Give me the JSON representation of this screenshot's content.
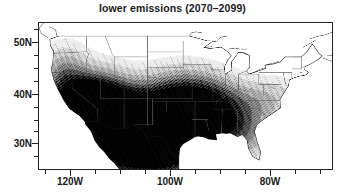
{
  "chart_data": {
    "type": "heatmap",
    "title": "lower emissions (2070–2099)",
    "xlabel": "",
    "ylabel": "",
    "grid": false,
    "legend": false,
    "projection": "lambert-conformal-conic",
    "region": "contiguous United States",
    "xlim": [
      -127,
      -65
    ],
    "ylim": [
      23.5,
      51.5
    ],
    "xtick_labels": [
      "120W",
      "100W",
      "80W"
    ],
    "xtick_values": [
      -120,
      -100,
      -80
    ],
    "xtick_minor_values": [
      -125,
      -115,
      -110,
      -105,
      -95,
      -90,
      -85,
      -75,
      -70
    ],
    "ytick_labels": [
      "50N",
      "40N",
      "30N"
    ],
    "ytick_values": [
      50,
      40,
      30
    ],
    "ytick_minor_values": [
      25,
      27.5,
      32.5,
      35,
      37.5,
      42.5,
      45,
      47.5
    ],
    "shading_description": "grayscale stippled density; darkest over the desert Southwest and northern Mexico, intermediate over the southern Great Plains and lower Mississippi valley, light over the Southeast and mid-Atlantic, white over the northern Rockies, northern Great Plains and Upper Midwest",
    "shading_scale": [
      "white",
      "#e8e8e8",
      "#cfcfcf",
      "#b0b0b0",
      "#8a8a8a",
      "#5a5a5a",
      "#2a2a2a",
      "#000000"
    ],
    "regions": [
      {
        "name": "desert Southwest",
        "intensity": 1.0,
        "shade": "#000000"
      },
      {
        "name": "southern California",
        "intensity": 0.95,
        "shade": "#111111"
      },
      {
        "name": "northern Mexico",
        "intensity": 0.98,
        "shade": "#050505"
      },
      {
        "name": "south Texas",
        "intensity": 0.85,
        "shade": "#333333"
      },
      {
        "name": "southern Great Plains",
        "intensity": 0.55,
        "shade": "#8a8a8a"
      },
      {
        "name": "lower Mississippi valley",
        "intensity": 0.45,
        "shade": "#a8a8a8"
      },
      {
        "name": "Southeast",
        "intensity": 0.25,
        "shade": "#d4d4d4"
      },
      {
        "name": "mid-Atlantic",
        "intensity": 0.2,
        "shade": "#dedede"
      },
      {
        "name": "Great Basin",
        "intensity": 0.6,
        "shade": "#787878"
      },
      {
        "name": "Pacific Northwest",
        "intensity": 0.3,
        "shade": "#c8c8c8"
      },
      {
        "name": "northern Rockies",
        "intensity": 0.05,
        "shade": "#ffffff"
      },
      {
        "name": "northern Great Plains",
        "intensity": 0.05,
        "shade": "#ffffff"
      },
      {
        "name": "Upper Midwest",
        "intensity": 0.1,
        "shade": "#f2f2f2"
      },
      {
        "name": "Northeast",
        "intensity": 0.08,
        "shade": "#f6f6f6"
      }
    ]
  },
  "colors": {
    "frame": "#222222",
    "text": "#1a1a1a",
    "background": "#ffffff",
    "coastline": "#111111",
    "state_border": "#555555"
  }
}
